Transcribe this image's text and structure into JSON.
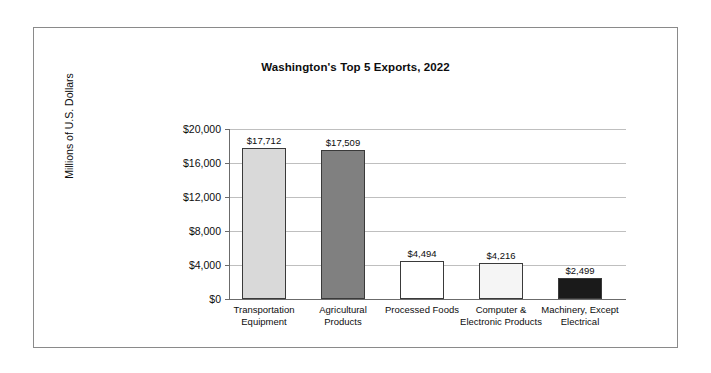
{
  "chart_data": {
    "type": "bar",
    "title": "Washington's Top 5 Exports, 2022",
    "xlabel": "",
    "ylabel": "Millions of U.S. Dollars",
    "ylim": [
      0,
      20000
    ],
    "ytick_labels": [
      "$0",
      "$4,000",
      "$8,000",
      "$12,000",
      "$16,000",
      "$20,000"
    ],
    "ytick_values": [
      0,
      4000,
      8000,
      12000,
      16000,
      20000
    ],
    "grid": true,
    "legend": "none",
    "categories": [
      "Transportation Equipment",
      "Agricultural Products",
      "Processed Foods",
      "Computer & Electronic Products",
      "Machinery, Except Electrical"
    ],
    "values": [
      17712,
      17509,
      4494,
      4216,
      2499
    ],
    "value_labels": [
      "$17,712",
      "$17,509",
      "$4,494",
      "$4,216",
      "$2,499"
    ],
    "bar_colors": [
      "#d9d9d9",
      "#808080",
      "#ffffff",
      "#f5f5f5",
      "#1a1a1a"
    ],
    "bar_border_color": "#3a3a3a"
  },
  "axis": {
    "line_color": "#6b6b6b",
    "gridline_color": "#bfbfbf"
  },
  "frame": {
    "border_color": "#8a8a8a"
  }
}
